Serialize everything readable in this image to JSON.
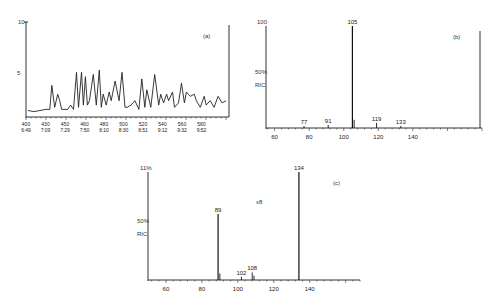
{
  "chart_data": [
    {
      "panel": "(a)",
      "type": "line",
      "title": "",
      "xlabel": "",
      "ylabel": "",
      "y_top_label": "10",
      "y_mid_label": "5",
      "x_ticks": [
        {
          "scan": "400",
          "time": "6:49"
        },
        {
          "scan": "430",
          "time": "7:09"
        },
        {
          "scan": "450",
          "time": "7:29"
        },
        {
          "scan": "460",
          "time": "7:50"
        },
        {
          "scan": "480",
          "time": "8:10"
        },
        {
          "scan": "500",
          "time": "8:30"
        },
        {
          "scan": "520",
          "time": "8:51"
        },
        {
          "scan": "540",
          "time": "9:12"
        },
        {
          "scan": "560",
          "time": "9:32"
        },
        {
          "scan": "580",
          "time": "9:52"
        }
      ],
      "grid": false,
      "description": "Total ion chromatogram with many peaks; relative heights read from trace",
      "x": [
        0,
        0.03,
        0.06,
        0.09,
        0.11,
        0.12,
        0.135,
        0.15,
        0.16,
        0.17,
        0.2,
        0.215,
        0.23,
        0.245,
        0.255,
        0.27,
        0.28,
        0.29,
        0.3,
        0.31,
        0.33,
        0.345,
        0.36,
        0.37,
        0.38,
        0.395,
        0.41,
        0.42,
        0.44,
        0.46,
        0.475,
        0.49,
        0.5,
        0.52,
        0.54,
        0.56,
        0.575,
        0.59,
        0.6,
        0.62,
        0.64,
        0.66,
        0.67,
        0.685,
        0.7,
        0.71,
        0.73,
        0.74,
        0.76,
        0.775,
        0.79,
        0.8,
        0.82,
        0.84,
        0.85,
        0.87,
        0.89,
        0.9,
        0.92,
        0.94,
        0.96,
        0.98,
        1.0
      ],
      "values": [
        5,
        4,
        5,
        6,
        6,
        28,
        8,
        20,
        14,
        6,
        6,
        10,
        6,
        40,
        8,
        40,
        10,
        36,
        10,
        14,
        38,
        10,
        42,
        8,
        20,
        10,
        22,
        14,
        32,
        14,
        40,
        8,
        8,
        10,
        14,
        6,
        34,
        8,
        24,
        8,
        38,
        10,
        20,
        12,
        20,
        14,
        22,
        8,
        12,
        30,
        12,
        22,
        18,
        20,
        14,
        8,
        18,
        10,
        14,
        8,
        18,
        12,
        14
      ]
    },
    {
      "panel": "(b)",
      "type": "bar",
      "title": "",
      "xlabel": "m/z",
      "ylabel": "Relative abundance",
      "y_top_label": "100",
      "y_mid_labels": [
        "50%",
        "RIC"
      ],
      "x_ticks": [
        60,
        80,
        100,
        120,
        140
      ],
      "xlim": [
        55,
        180
      ],
      "ylim": [
        0,
        100
      ],
      "grid": false,
      "peaks": [
        {
          "mz": 77,
          "intensity": 2,
          "label": "77"
        },
        {
          "mz": 91,
          "intensity": 3,
          "label": "91"
        },
        {
          "mz": 105,
          "intensity": 100,
          "label": "105"
        },
        {
          "mz": 106,
          "intensity": 8,
          "label": ""
        },
        {
          "mz": 119,
          "intensity": 5,
          "label": "119"
        },
        {
          "mz": 133,
          "intensity": 2,
          "label": "133"
        }
      ]
    },
    {
      "panel": "(c)",
      "type": "bar",
      "title": "",
      "xlabel": "m/z",
      "ylabel": "Relative abundance",
      "y_top_label": "11%",
      "y_mid_labels": [
        "50%",
        "RIC"
      ],
      "x_ticks": [
        60,
        80,
        100,
        120,
        140
      ],
      "xlim": [
        50,
        168
      ],
      "ylim": [
        0,
        100
      ],
      "grid": false,
      "annotation": "x8",
      "peaks": [
        {
          "mz": 89,
          "intensity": 61,
          "label": "89"
        },
        {
          "mz": 90,
          "intensity": 6,
          "label": ""
        },
        {
          "mz": 102,
          "intensity": 3,
          "label": "102"
        },
        {
          "mz": 108,
          "intensity": 7,
          "label": "108"
        },
        {
          "mz": 109,
          "intensity": 4,
          "label": ""
        },
        {
          "mz": 134,
          "intensity": 100,
          "label": "134"
        }
      ]
    }
  ],
  "panels": {
    "a": {
      "tag": "(a)",
      "ytop": "10",
      "ymid": "5"
    },
    "b": {
      "tag": "(b)",
      "ytop": "100",
      "ymid1": "50%",
      "ymid2": "RIC"
    },
    "c": {
      "tag": "(c)",
      "ytop": "11%",
      "ymid1": "50%",
      "ymid2": "RIC",
      "annotation": "x8"
    }
  }
}
